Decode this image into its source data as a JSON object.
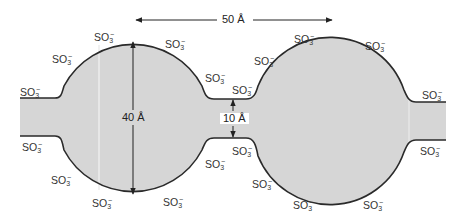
{
  "diagram": {
    "colors": {
      "fill": "#d6d6d6",
      "outline": "#2a2a2a",
      "text": "#333333",
      "background": "#ffffff"
    },
    "dimensions": {
      "cluster_spacing": "50 Å",
      "cluster_diameter": "40 Å",
      "channel_width": "10 Å"
    },
    "group_label": {
      "base": "SO",
      "subscript": "3",
      "superscript": "−"
    },
    "sulfonate_positions": [
      {
        "id": "left-channel-top",
        "x": 20,
        "y": 86
      },
      {
        "id": "left-sphere-upper-left",
        "x": 52,
        "y": 53
      },
      {
        "id": "left-sphere-top-left",
        "x": 94,
        "y": 31
      },
      {
        "id": "left-sphere-top-right",
        "x": 165,
        "y": 38
      },
      {
        "id": "left-sphere-upper-right",
        "x": 205,
        "y": 72
      },
      {
        "id": "neck-top-left",
        "x": 232,
        "y": 84
      },
      {
        "id": "neck-top-right",
        "x": 254,
        "y": 55
      },
      {
        "id": "right-sphere-top-left",
        "x": 294,
        "y": 33
      },
      {
        "id": "right-sphere-top-right",
        "x": 365,
        "y": 40
      },
      {
        "id": "right-channel-top",
        "x": 422,
        "y": 89
      },
      {
        "id": "left-channel-bottom",
        "x": 22,
        "y": 141
      },
      {
        "id": "left-sphere-lower-left",
        "x": 51,
        "y": 174
      },
      {
        "id": "left-sphere-bottom-left",
        "x": 92,
        "y": 197
      },
      {
        "id": "left-sphere-bottom-right",
        "x": 163,
        "y": 196
      },
      {
        "id": "left-sphere-lower-right",
        "x": 205,
        "y": 158
      },
      {
        "id": "neck-bottom-left",
        "x": 232,
        "y": 145
      },
      {
        "id": "neck-bottom-right",
        "x": 252,
        "y": 178
      },
      {
        "id": "right-sphere-bottom-left",
        "x": 293,
        "y": 199
      },
      {
        "id": "right-sphere-bottom-right",
        "x": 363,
        "y": 199
      },
      {
        "id": "right-channel-bottom",
        "x": 420,
        "y": 145
      }
    ]
  }
}
